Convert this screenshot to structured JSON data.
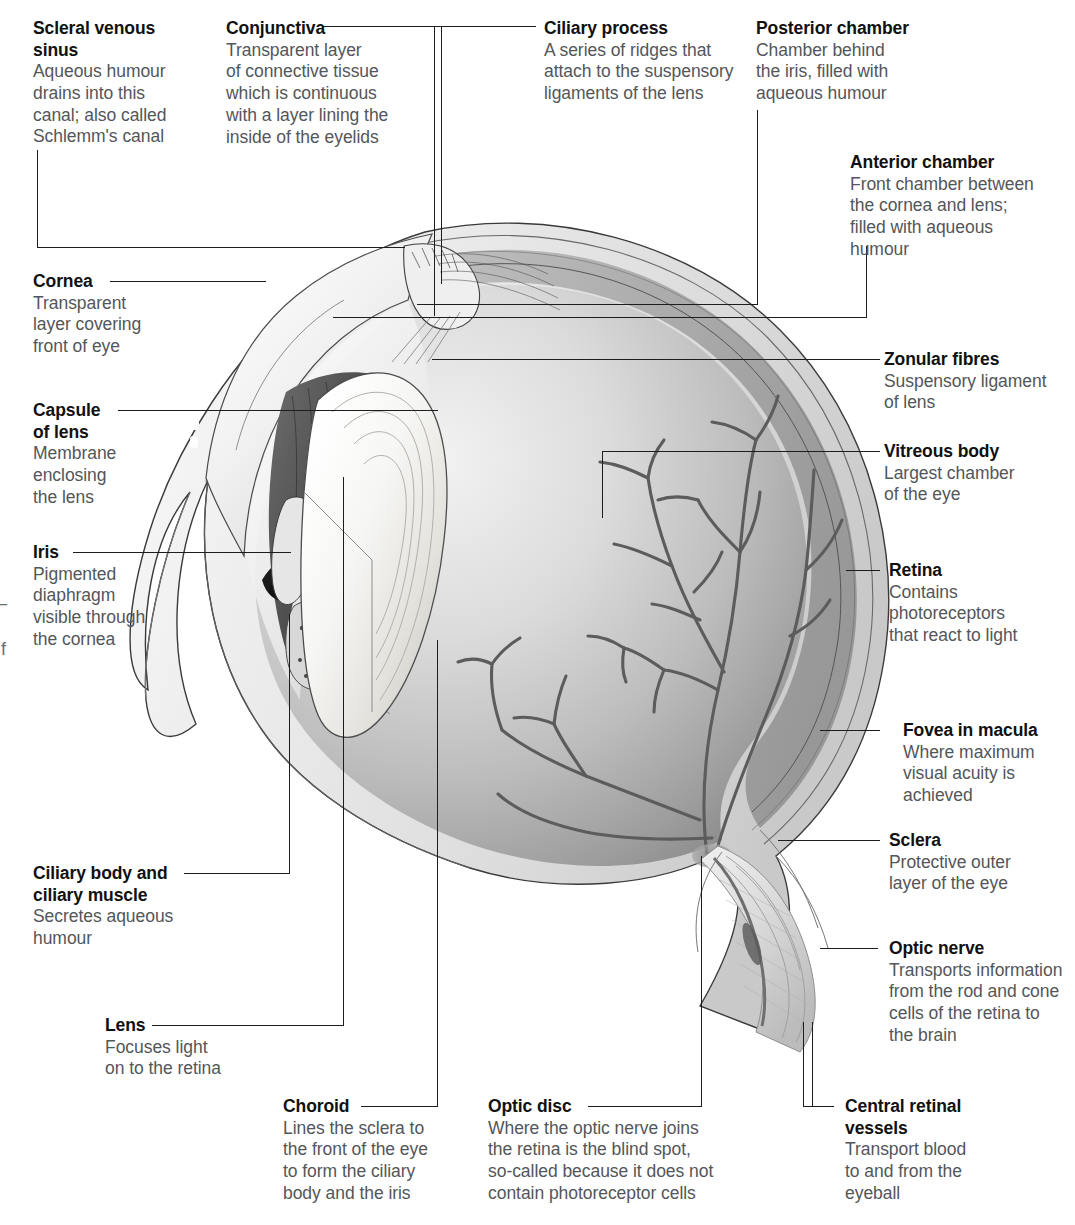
{
  "diagram": {
    "type": "anatomical-illustration",
    "style": "grayscale airbrush cross-section",
    "background_color": "#ffffff",
    "text_color_title": "#111111",
    "text_color_body": "#53565a",
    "leader_line_color": "#1d1d1f"
  },
  "page_bleed": {
    "dash": "–",
    "letter": "f"
  },
  "labels": [
    {
      "id": "scleral-venous-sinus",
      "title": "Scleral venous",
      "title2": "sinus",
      "desc": [
        "Aqueous humour",
        "drains into this",
        "canal; also called",
        "Schlemm's canal"
      ]
    },
    {
      "id": "conjunctiva",
      "title": "Conjunctiva",
      "desc": [
        "Transparent layer",
        "of connective tissue",
        "which is continuous",
        "with a layer lining the",
        "inside of the eyelids"
      ]
    },
    {
      "id": "ciliary-process",
      "title": "Ciliary process",
      "desc": [
        "A series of ridges that",
        "attach to the suspensory",
        "ligaments of the lens"
      ]
    },
    {
      "id": "posterior-chamber",
      "title": "Posterior chamber",
      "desc": [
        "Chamber behind",
        "the iris, filled with",
        "aqueous humour"
      ]
    },
    {
      "id": "anterior-chamber",
      "title": "Anterior chamber",
      "desc": [
        "Front chamber between",
        "the cornea and lens;",
        "filled with aqueous",
        "humour"
      ]
    },
    {
      "id": "cornea",
      "title": "Cornea",
      "desc": [
        "Transparent",
        "layer covering",
        "front of eye"
      ]
    },
    {
      "id": "capsule-of-lens",
      "title": "Capsule",
      "title2": "of lens",
      "desc": [
        "Membrane",
        "enclosing",
        "the lens"
      ]
    },
    {
      "id": "iris",
      "title": "Iris",
      "desc": [
        "Pigmented",
        "diaphragm",
        "visible through",
        "the cornea"
      ]
    },
    {
      "id": "zonular-fibres",
      "title": "Zonular fibres",
      "desc": [
        "Suspensory ligament",
        "of lens"
      ]
    },
    {
      "id": "vitreous-body",
      "title": "Vitreous body",
      "desc": [
        "Largest chamber",
        "of the eye"
      ]
    },
    {
      "id": "retina",
      "title": "Retina",
      "desc": [
        "Contains",
        "photoreceptors",
        "that react to light"
      ]
    },
    {
      "id": "fovea-in-macula",
      "title": "Fovea in macula",
      "desc": [
        "Where maximum",
        "visual acuity is",
        "achieved"
      ]
    },
    {
      "id": "sclera",
      "title": "Sclera",
      "desc": [
        "Protective outer",
        "layer of the eye"
      ]
    },
    {
      "id": "optic-nerve",
      "title": "Optic nerve",
      "desc": [
        "Transports information",
        "from the rod and cone",
        "cells of the retina to",
        "the brain"
      ]
    },
    {
      "id": "ciliary-body-and-ciliary-muscle",
      "title": "Ciliary body and",
      "title2": "ciliary muscle",
      "desc": [
        "Secretes aqueous",
        "humour"
      ]
    },
    {
      "id": "lens",
      "title": "Lens",
      "desc": [
        "Focuses light",
        "on to the retina"
      ]
    },
    {
      "id": "choroid",
      "title": "Choroid",
      "desc": [
        "Lines the sclera to",
        "the front of the eye",
        "to form the ciliary",
        "body and the iris"
      ]
    },
    {
      "id": "optic-disc",
      "title": "Optic disc",
      "desc": [
        "Where the optic nerve joins",
        "the retina is the blind spot,",
        "so-called because it does not",
        "contain photoreceptor cells"
      ]
    },
    {
      "id": "central-retinal-vessels",
      "title": "Central retinal",
      "title2": "vessels",
      "desc": [
        "Transport blood",
        "to and from the",
        "eyeball"
      ]
    }
  ]
}
